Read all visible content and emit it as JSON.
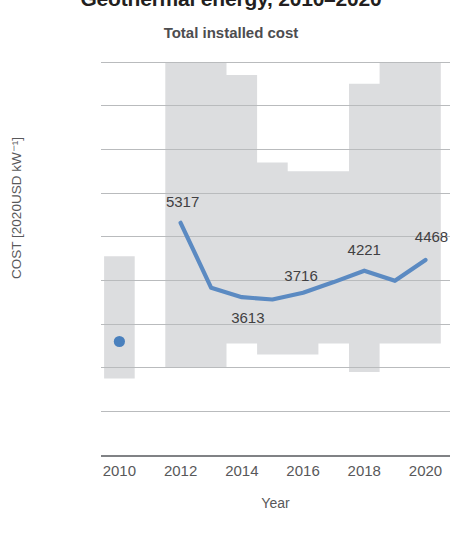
{
  "title": "Geothermal energy, 2010–2020",
  "subtitle": "Total installed cost",
  "axis": {
    "y_title": "COST [2020USD kW⁻¹]",
    "x_title": "Year"
  },
  "colors": {
    "line": "#5b8ac2",
    "marker": "#4a80bd",
    "band": "#dcdddf",
    "grid": "#b9bbbd",
    "axis": "#808285",
    "text": "#58585a",
    "title": "#231f20"
  },
  "chart_data": {
    "type": "line",
    "title": "Geothermal energy, 2010–2020",
    "subtitle": "Total installed cost",
    "xlabel": "Year",
    "ylabel": "COST [2020USD kW⁻¹]",
    "xlim": [
      2009.4,
      2020.8
    ],
    "ylim": [
      0,
      9000
    ],
    "ytick_labels": [
      "0",
      "1000",
      "2000",
      "3000",
      "4000",
      "5000",
      "6000",
      "7000",
      "8000",
      "9000"
    ],
    "yticks": [
      0,
      1000,
      2000,
      3000,
      4000,
      5000,
      6000,
      7000,
      8000,
      9000
    ],
    "xtick_labels": [
      "2010",
      "2012",
      "2014",
      "2016",
      "2018",
      "2020"
    ],
    "xticks": [
      2010,
      2012,
      2014,
      2016,
      2018,
      2020
    ],
    "grid": "horizontal",
    "legend": "none",
    "series": [
      {
        "name": "Weighted average total installed cost",
        "type": "line",
        "x": [
          2012,
          2013,
          2014,
          2015,
          2016,
          2017,
          2018,
          2019,
          2020
        ],
        "values": [
          5317,
          3830,
          3613,
          3560,
          3716,
          3960,
          4221,
          3990,
          4468
        ]
      },
      {
        "name": "2010 individual project",
        "type": "scatter",
        "x": [
          2010
        ],
        "values": [
          2600
        ]
      },
      {
        "name": "5th to 95th percentile range",
        "type": "band",
        "x": [
          2010,
          2012,
          2013,
          2014,
          2015,
          2016,
          2017,
          2018,
          2019,
          2020
        ],
        "lower": [
          1750,
          2000,
          2000,
          2550,
          2300,
          2300,
          2550,
          1900,
          2550,
          2550
        ],
        "upper": [
          4550,
          9400,
          9400,
          8700,
          6700,
          6500,
          6500,
          8500,
          9400,
          9400
        ]
      }
    ],
    "point_labels": [
      {
        "x": 2012,
        "value": 5317,
        "text": "5317"
      },
      {
        "x": 2014,
        "value": 3613,
        "text": "3613"
      },
      {
        "x": 2016,
        "value": 3716,
        "text": "3716"
      },
      {
        "x": 2018,
        "value": 4221,
        "text": "4221"
      },
      {
        "x": 2020,
        "value": 4468,
        "text": "4468"
      }
    ]
  }
}
